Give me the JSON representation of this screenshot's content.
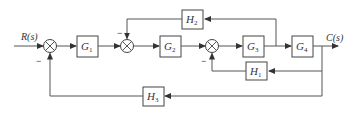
{
  "diagram": {
    "type": "control-system-block-diagram",
    "input_label": "R(s)",
    "output_label": "C(s)",
    "blocks": {
      "G1": {
        "name": "G",
        "sub": "1"
      },
      "G2": {
        "name": "G",
        "sub": "2"
      },
      "G3": {
        "name": "G",
        "sub": "3"
      },
      "G4": {
        "name": "G",
        "sub": "4"
      },
      "H1": {
        "name": "H",
        "sub": "1"
      },
      "H2": {
        "name": "H",
        "sub": "2"
      },
      "H3": {
        "name": "H",
        "sub": "3"
      }
    },
    "summing_junctions": [
      {
        "id": "S1",
        "feedback_sign": "−"
      },
      {
        "id": "S2",
        "feedback_sign": "−"
      },
      {
        "id": "S3",
        "feedback_sign": "−"
      }
    ],
    "connections": [
      "R(s) → S1 → G1 → S2 → G2 → S3 → G3 → G4 → C(s)",
      "G3 output → H2 → S2 (−)",
      "C(s) → H1 → S3 (−)",
      "C(s) → H3 → S1 (−)"
    ],
    "colors": {
      "line": "#555555",
      "background": "#ffffff"
    }
  }
}
